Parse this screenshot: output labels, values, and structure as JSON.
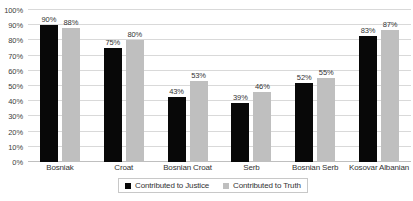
{
  "chart_data": {
    "type": "bar",
    "title": "",
    "subtitle": "",
    "xlabel": "",
    "ylabel": "",
    "ylim": [
      0,
      100
    ],
    "y_ticks": [
      "0%",
      "10%",
      "20%",
      "30%",
      "40%",
      "50%",
      "60%",
      "70%",
      "80%",
      "90%",
      "100%"
    ],
    "y_tick_values": [
      0,
      10,
      20,
      30,
      40,
      50,
      60,
      70,
      80,
      90,
      100
    ],
    "grid": true,
    "legend_position": "bottom",
    "categories": [
      "Bosniak",
      "Croat",
      "Bosnian Croat",
      "Serb",
      "Bosnian Serb",
      "Kosovar Albanian"
    ],
    "series": [
      {
        "name": "Contributed to Justice",
        "color": "#080808",
        "values": [
          90,
          75,
          43,
          39,
          52,
          83
        ],
        "data_labels": [
          "90%",
          "75%",
          "43%",
          "39%",
          "52%",
          "83%"
        ]
      },
      {
        "name": "Contributed to Truth",
        "color": "#BFBFBF",
        "values": [
          88,
          80,
          53,
          46,
          55,
          87
        ],
        "data_labels": [
          "88%",
          "80%",
          "53%",
          "46%",
          "55%",
          "87%"
        ]
      }
    ]
  },
  "legend": {
    "entries": [
      {
        "label": "Contributed to Justice",
        "swatch": "justice"
      },
      {
        "label": "Contributed to Truth",
        "swatch": "truth"
      }
    ]
  },
  "colors": {
    "justice": "#080808",
    "truth": "#BFBFBF",
    "gridline": "#D9D9D9",
    "axis": "#BFBFBF",
    "text": "#333333",
    "background": "#FFFFFF"
  }
}
